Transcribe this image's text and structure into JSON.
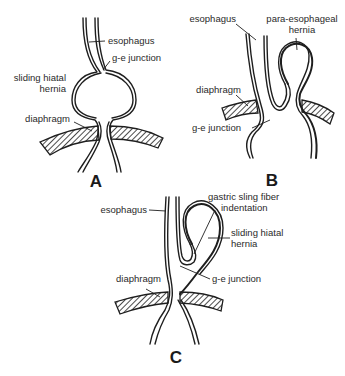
{
  "figure": {
    "panels": [
      {
        "id": "A",
        "letter": "A",
        "labels": {
          "esophagus": "esophagus",
          "ge_junction": "g-e junction",
          "hernia_line1": "sliding hiatal",
          "hernia_line2": "hernia",
          "diaphragm": "diaphragm"
        }
      },
      {
        "id": "B",
        "letter": "B",
        "labels": {
          "esophagus": "esophagus",
          "hernia_line1": "para-esophageal",
          "hernia_line2": "hernia",
          "diaphragm": "diaphragm",
          "ge_junction": "g-e junction"
        }
      },
      {
        "id": "C",
        "letter": "C",
        "labels": {
          "esophagus": "esophagus",
          "sling_line1": "gastric sling fiber",
          "sling_line2": "indentation",
          "hernia_line1": "sliding hiatal",
          "hernia_line2": "hernia",
          "diaphragm": "diaphragm",
          "ge_junction": "g-e junction"
        }
      }
    ],
    "colors": {
      "line": "#1e1e1e",
      "text": "#2a2a2a",
      "background": "#ffffff"
    }
  }
}
